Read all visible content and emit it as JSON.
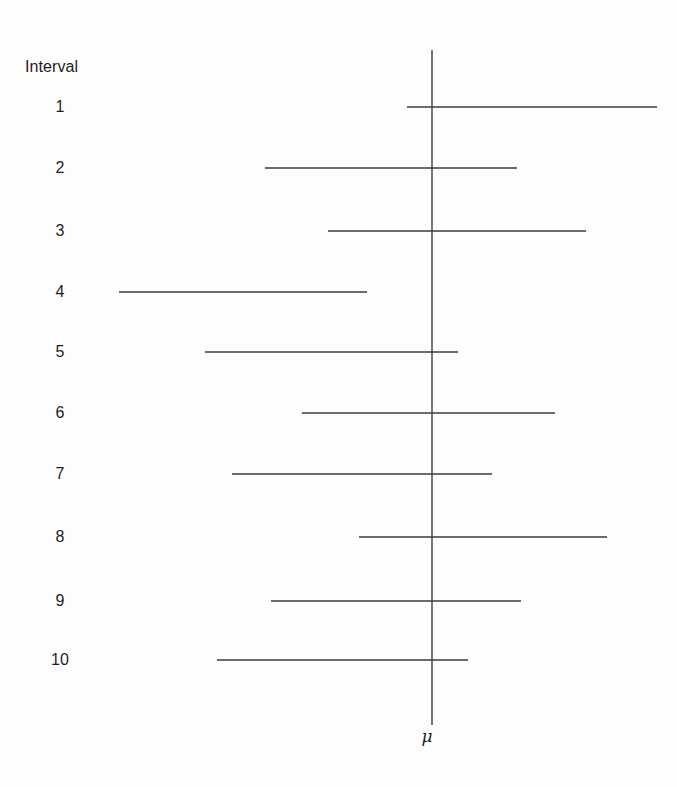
{
  "figure": {
    "background_color": "#fdfdfd",
    "line_color": "#3a3a3a",
    "text_color": "#1d1d1d",
    "width": 677,
    "height": 787,
    "column_header": "Interval",
    "header_x": 25,
    "header_y": 58,
    "label_x": 60,
    "mu_symbol": "μ",
    "mu_label_x": 427,
    "mu_label_y": 736
  },
  "chart_data": {
    "type": "line",
    "title": "",
    "subtitle": "",
    "xlabel": "",
    "ylabel": "Interval",
    "legend": [],
    "grid": false,
    "reference_line": {
      "name": "mu",
      "label": "μ",
      "x": 432,
      "y_top": 50,
      "y_bottom": 725
    },
    "categories": [
      "1",
      "2",
      "3",
      "4",
      "5",
      "6",
      "7",
      "8",
      "9",
      "10"
    ],
    "intervals": [
      {
        "label": "1",
        "y": 107,
        "left": 407,
        "right": 657,
        "contains_mu": true
      },
      {
        "label": "2",
        "y": 168,
        "left": 265,
        "right": 517,
        "contains_mu": true
      },
      {
        "label": "3",
        "y": 231,
        "left": 328,
        "right": 586,
        "contains_mu": true
      },
      {
        "label": "4",
        "y": 292,
        "left": 119,
        "right": 367,
        "contains_mu": false
      },
      {
        "label": "5",
        "y": 352,
        "left": 205,
        "right": 458,
        "contains_mu": true
      },
      {
        "label": "6",
        "y": 413,
        "left": 302,
        "right": 555,
        "contains_mu": true
      },
      {
        "label": "7",
        "y": 474,
        "left": 232,
        "right": 492,
        "contains_mu": true
      },
      {
        "label": "8",
        "y": 537,
        "left": 359,
        "right": 607,
        "contains_mu": true
      },
      {
        "label": "9",
        "y": 601,
        "left": 271,
        "right": 521,
        "contains_mu": true
      },
      {
        "label": "10",
        "y": 660,
        "left": 217,
        "right": 468,
        "contains_mu": true
      }
    ]
  }
}
